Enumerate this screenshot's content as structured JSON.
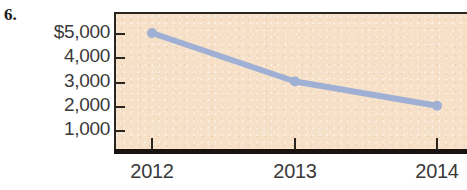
{
  "problem": {
    "number": "6."
  },
  "colors": {
    "plot_background": "#f6e1c8",
    "line": "#9fb0d4",
    "marker": "#9fb0d4",
    "axis": "#181310",
    "tick_label": "#3a3a3a"
  },
  "chart_data": {
    "type": "line",
    "title": "",
    "xlabel": "",
    "ylabel": "",
    "categories": [
      "2012",
      "2013",
      "2014"
    ],
    "values": [
      5000,
      3000,
      2000
    ],
    "series": [
      {
        "name": "",
        "values": [
          5000,
          3000,
          2000
        ]
      }
    ],
    "x_tick_labels": [
      "2012",
      "2013",
      "2014"
    ],
    "y_tick_labels": [
      "$5,000",
      "4,000",
      "3,000",
      "2,000",
      "1,000"
    ],
    "y_tick_values": [
      5000,
      4000,
      3000,
      2000,
      1000
    ],
    "ylim": [
      0,
      5700
    ],
    "grid": false,
    "legend": false,
    "legend_position": "none",
    "markers": true,
    "annotations": []
  }
}
